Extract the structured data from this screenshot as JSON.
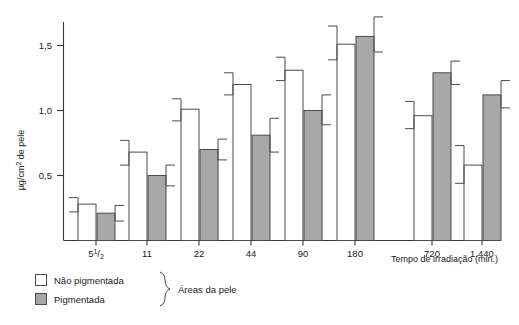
{
  "chart_data": {
    "type": "bar",
    "title": "",
    "subtitle": "",
    "xlabel": "Tempo de irradiação (min.)",
    "ylabel": "μg/cm² de pele",
    "ylim": [
      0,
      1.75
    ],
    "yticks": [
      0.5,
      1.0,
      1.5
    ],
    "ytick_labels": [
      "0,5",
      "1,0",
      "1,5"
    ],
    "categories": [
      "5 1/2",
      "11",
      "22",
      "44",
      "90",
      "180",
      "720",
      "1.440"
    ],
    "category_labels": [
      "5½",
      "11",
      "22",
      "44",
      "90",
      "180",
      "720",
      "1.440"
    ],
    "grid": false,
    "legend_position": "below-left",
    "axis_break_after_category": "180",
    "series": [
      {
        "name": "Não pigmentada",
        "color": "#ffffff",
        "values": [
          0.28,
          0.68,
          1.01,
          1.2,
          1.31,
          1.51,
          0.96,
          0.58
        ],
        "err_low": [
          0.22,
          0.58,
          0.92,
          1.12,
          1.23,
          1.39,
          0.86,
          0.44
        ],
        "err_high": [
          0.33,
          0.77,
          1.09,
          1.29,
          1.41,
          1.65,
          1.07,
          0.73
        ]
      },
      {
        "name": "Pigmentada",
        "color": "#a8a8a8",
        "values": [
          0.21,
          0.5,
          0.7,
          0.81,
          1.0,
          1.57,
          1.29,
          1.12
        ],
        "err_low": [
          0.15,
          0.42,
          0.62,
          0.68,
          0.89,
          1.45,
          1.2,
          1.02
        ],
        "err_high": [
          0.27,
          0.58,
          0.78,
          0.94,
          1.12,
          1.72,
          1.38,
          1.23
        ]
      }
    ]
  },
  "legend": {
    "items": [
      {
        "label": "Não pigmentada",
        "swatch": "white-square"
      },
      {
        "label": "Pigmentada",
        "swatch": "gray-square"
      }
    ],
    "group_label": "Áreas da pele"
  },
  "axis": {
    "x_caption": "Tempo de irradiação (min.)",
    "y_caption": "μg/cm² de pele",
    "y_tick_labels": [
      "1,5",
      "1,0",
      "0,5"
    ]
  }
}
